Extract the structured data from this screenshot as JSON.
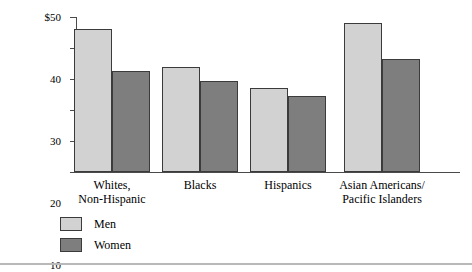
{
  "chart_data": {
    "type": "bar",
    "title": "",
    "xlabel": "",
    "ylabel": "Median Income (thousands)",
    "ylim": [
      0,
      50
    ],
    "yticks": [
      0,
      10,
      20,
      30,
      40,
      50
    ],
    "ytick_labels": [
      "0",
      "10",
      "20",
      "30",
      "40",
      "$50"
    ],
    "grid": false,
    "legend_position": "bottom-left",
    "categories": [
      "Whites,\nNon-Hispanic",
      "Blacks",
      "Hispanics",
      "Asian Americans/\nPacific Islanders"
    ],
    "series": [
      {
        "name": "Men",
        "color": "#d2d2d2",
        "values": [
          46,
          34,
          27,
          48
        ]
      },
      {
        "name": "Women",
        "color": "#7e7e7e",
        "values": [
          32.5,
          29.5,
          24.5,
          36.5
        ]
      }
    ]
  },
  "legend": {
    "items": [
      {
        "label": "Men"
      },
      {
        "label": "Women"
      }
    ]
  },
  "colors": {
    "men_fill": "#d2d2d2",
    "women_fill": "#7e7e7e",
    "bar_border": "#3b3b3b",
    "axis": "#4a4a4a",
    "rule": "#b9b9b9"
  }
}
